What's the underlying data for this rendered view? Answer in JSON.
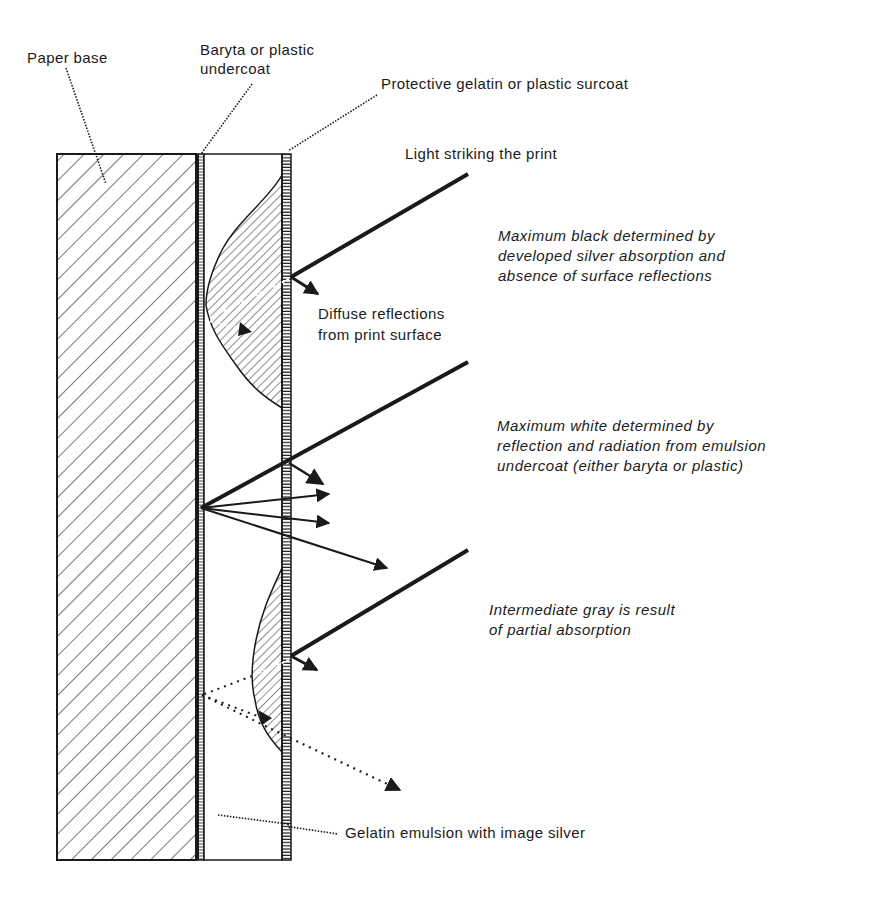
{
  "diagram": {
    "labels": {
      "paper_base": "Paper base",
      "baryta_line1": "Baryta or plastic",
      "baryta_line2": "undercoat",
      "surcoat": "Protective gelatin or plastic surcoat",
      "light": "Light striking the print",
      "max_black": [
        "Maximum black  determined by",
        "developed silver  absorption and",
        "absence of surface reflections"
      ],
      "diffuse": [
        "Diffuse reflections",
        "from print surface"
      ],
      "max_white": [
        "Maximum white determined by",
        "reflection and radiation from emulsion",
        "undercoat (either baryta or plastic)"
      ],
      "intermediate": [
        "Intermediate gray is result",
        "of partial absorption"
      ],
      "emulsion": "Gelatin emulsion with image silver"
    },
    "layers": [
      {
        "name": "Paper base",
        "x0": 57,
        "x1": 196,
        "pattern": "diagonal-hatch"
      },
      {
        "name": "Baryta or plastic undercoat",
        "x0": 196,
        "x1": 204,
        "pattern": "fine-vertical"
      },
      {
        "name": "Gelatin emulsion with image silver",
        "x0": 204,
        "x1": 282,
        "pattern": "white"
      },
      {
        "name": "Protective gelatin or plastic surcoat",
        "x0": 282,
        "x1": 291,
        "pattern": "horizontal-ticks"
      }
    ],
    "colors": {
      "ink": "#1a1a1a",
      "background": "#ffffff"
    }
  }
}
